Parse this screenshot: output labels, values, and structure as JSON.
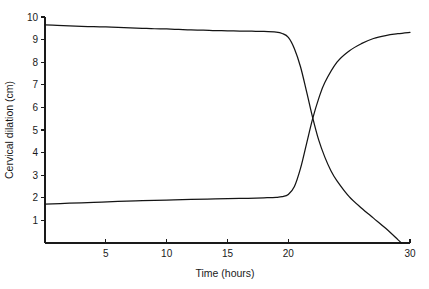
{
  "chart_data": {
    "type": "line",
    "title": "",
    "xlabel": "Time (hours)",
    "ylabel": "Cervical dilation (cm)",
    "xlim": [
      0,
      30
    ],
    "ylim": [
      0,
      10
    ],
    "grid": false,
    "legend": "none",
    "xticks": [
      5,
      10,
      15,
      20,
      30
    ],
    "xtick_labels": [
      "5",
      "10",
      "15",
      "20",
      "30"
    ],
    "yticks": [
      1,
      2,
      3,
      4,
      5,
      6,
      7,
      8,
      9,
      10
    ],
    "ytick_labels": [
      "1",
      "2",
      "3",
      "4",
      "5",
      "6",
      "7",
      "8",
      "9",
      "10"
    ],
    "series": [
      {
        "name": "descending-curve",
        "x": [
          0,
          1,
          2,
          3,
          4,
          5,
          6,
          7,
          8,
          9,
          10,
          11,
          12,
          13,
          14,
          15,
          16,
          17,
          18,
          19,
          19.5,
          20,
          20.5,
          21,
          21.5,
          22,
          22.5,
          23,
          23.5,
          24,
          25,
          26,
          27,
          28,
          29,
          29.3
        ],
        "y": [
          9.65,
          9.63,
          9.61,
          9.59,
          9.57,
          9.56,
          9.54,
          9.52,
          9.5,
          9.48,
          9.47,
          9.45,
          9.43,
          9.42,
          9.4,
          9.39,
          9.38,
          9.37,
          9.36,
          9.33,
          9.27,
          9.1,
          8.6,
          7.8,
          6.7,
          5.55,
          4.55,
          3.8,
          3.2,
          2.75,
          2.05,
          1.55,
          1.1,
          0.65,
          0.15,
          0.0
        ]
      },
      {
        "name": "ascending-curve",
        "x": [
          0,
          2,
          4,
          6,
          8,
          10,
          12,
          14,
          16,
          18,
          19,
          19.5,
          20,
          20.5,
          21,
          21.5,
          22,
          22.5,
          23,
          24,
          25,
          26,
          27,
          28,
          29,
          30
        ],
        "y": [
          1.72,
          1.76,
          1.8,
          1.84,
          1.87,
          1.9,
          1.93,
          1.95,
          1.97,
          2.0,
          2.02,
          2.05,
          2.15,
          2.5,
          3.3,
          4.4,
          5.5,
          6.4,
          7.1,
          8.0,
          8.5,
          8.82,
          9.05,
          9.18,
          9.26,
          9.32
        ]
      }
    ]
  },
  "layout": {
    "plot_left_px": 45,
    "plot_right_px": 410,
    "plot_top_px": 17,
    "plot_bottom_px": 243
  },
  "colors": {
    "curve": "#141414",
    "axis": "#1a1a1a",
    "background": "#ffffff"
  }
}
